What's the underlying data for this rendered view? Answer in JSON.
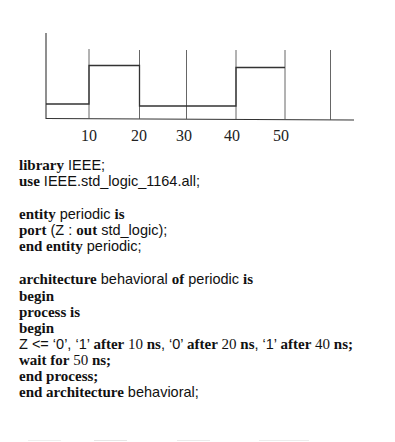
{
  "waveform": {
    "signal": "Z",
    "tick_labels": [
      "10",
      "20",
      "30",
      "40",
      "50"
    ],
    "gridline_times_ns": [
      10,
      20,
      30,
      40,
      50,
      60
    ],
    "transitions": [
      {
        "time_ns": 0,
        "level": "0"
      },
      {
        "time_ns": 10,
        "level": "1"
      },
      {
        "time_ns": 20,
        "level": "0"
      },
      {
        "time_ns": 40,
        "level": "1"
      },
      {
        "time_ns": 50,
        "level": "end"
      }
    ]
  },
  "code": {
    "l1": {
      "kw": "library",
      "rest": " IEEE;"
    },
    "l2": {
      "kw": "use",
      "rest": " IEEE.std_logic_1164.all;"
    },
    "l3": {
      "kw1": "entity",
      "id": " periodic ",
      "kw2": "is"
    },
    "l4": {
      "kw1": "port",
      "p1": " (Z : ",
      "kw2": "out",
      "p2": " std_logic);"
    },
    "l5": {
      "kw": "end entity",
      "rest": " periodic;"
    },
    "l6": {
      "kw1": "architecture",
      "id1": " behavioral ",
      "kw2": "of",
      "id2": " periodic ",
      "kw3": "is"
    },
    "l7": {
      "kw": "begin"
    },
    "l8": {
      "kw": "process is"
    },
    "l9": {
      "kw": "begin"
    },
    "l10": {
      "a": "Z <= ‘0’, ‘1’ ",
      "after1": "after",
      "n1": " 10 ",
      "ns1": "ns",
      "b": ", ‘0’ ",
      "after2": "after",
      "n2": " 20 ",
      "ns2": "ns",
      "c": ", ‘1’ ",
      "after3": "after",
      "n3": " 40 ",
      "ns3": "ns;"
    },
    "l11": {
      "kw": "wait for",
      "n": " 50 ",
      "ns": "ns;"
    },
    "l12": {
      "kw": "end process;"
    },
    "l13": {
      "kw": "end architecture",
      "rest": " behavioral;"
    }
  }
}
